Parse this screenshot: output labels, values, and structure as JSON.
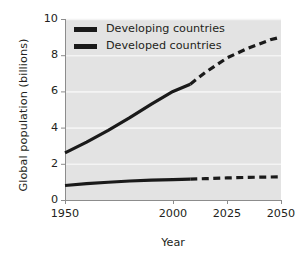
{
  "chart_data": {
    "type": "line",
    "title": "",
    "xlabel": "Year",
    "ylabel": "Global population (billions)",
    "xlim": [
      1950,
      2050
    ],
    "ylim": [
      0,
      10
    ],
    "xticks": [
      1950,
      2000,
      2025,
      2050
    ],
    "yticks": [
      0,
      2,
      4,
      6,
      8,
      10
    ],
    "xtick_labels": [
      "1950",
      "2000",
      "2025",
      "2050"
    ],
    "ytick_labels": [
      "0",
      "2",
      "4",
      "6",
      "8",
      "10"
    ],
    "grid": "horizontal-white-gridlines",
    "legend_position": "upper-left-inside",
    "projection_start_year": 2008,
    "series": [
      {
        "name": "Developing countries",
        "color": "#1a1a1a",
        "historical_style": "solid",
        "projected_style": "dashed",
        "x": [
          1950,
          1960,
          1970,
          1980,
          1990,
          2000,
          2008,
          2015,
          2025,
          2035,
          2045,
          2050
        ],
        "values": [
          2.6,
          3.2,
          3.85,
          4.55,
          5.3,
          6.0,
          6.4,
          7.05,
          7.85,
          8.4,
          8.85,
          9.0
        ]
      },
      {
        "name": "Developed countries",
        "color": "#1a1a1a",
        "historical_style": "solid",
        "projected_style": "dashed",
        "x": [
          1950,
          1960,
          1970,
          1980,
          1990,
          2000,
          2008,
          2015,
          2025,
          2035,
          2045,
          2050
        ],
        "values": [
          0.8,
          0.9,
          0.98,
          1.05,
          1.1,
          1.13,
          1.15,
          1.18,
          1.22,
          1.25,
          1.27,
          1.28
        ]
      }
    ],
    "legend": [
      {
        "label": "Developing countries",
        "style": "dashed",
        "color": "#1a1a1a"
      },
      {
        "label": "Developed countries",
        "style": "solid",
        "color": "#1a1a1a"
      }
    ]
  },
  "style": {
    "plot_background": "#e3e3e3",
    "gridline_color": "#f4f4f4",
    "axis_color": "#8c8c8c",
    "text_color": "#231f20",
    "page_background": "#ffffff"
  }
}
